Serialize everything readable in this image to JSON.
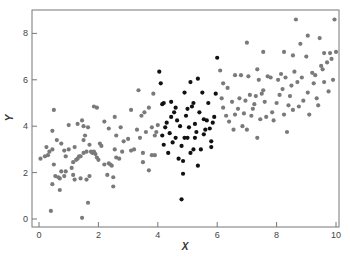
{
  "chart_data": {
    "type": "scatter",
    "title": "",
    "xlabel": "X",
    "ylabel": "Y",
    "xlim": [
      -0.2,
      10.1
    ],
    "ylim": [
      -0.35,
      9.0
    ],
    "xticks": [
      0,
      2,
      4,
      6,
      8,
      10
    ],
    "yticks": [
      0,
      2,
      4,
      6,
      8
    ],
    "grid": false,
    "legend": null,
    "colors": {
      "gray": "#7a7a7a",
      "black": "#111111",
      "axis": "#777777"
    },
    "series": [
      {
        "name": "outside 4–6 (gray)",
        "color": "#7a7a7a",
        "points": [
          [
            0.05,
            2.6
          ],
          [
            0.2,
            2.7
          ],
          [
            0.25,
            3.1
          ],
          [
            0.3,
            2.75
          ],
          [
            0.35,
            2.9
          ],
          [
            0.45,
            3.0
          ],
          [
            0.45,
            3.8
          ],
          [
            0.45,
            1.5
          ],
          [
            0.4,
            0.35
          ],
          [
            0.5,
            2.35
          ],
          [
            0.55,
            1.85
          ],
          [
            0.6,
            3.4
          ],
          [
            0.65,
            1.8
          ],
          [
            0.7,
            1.75
          ],
          [
            0.7,
            1.25
          ],
          [
            0.75,
            2.05
          ],
          [
            0.75,
            3.25
          ],
          [
            0.85,
            1.85
          ],
          [
            0.85,
            2.95
          ],
          [
            0.9,
            2.05
          ],
          [
            0.9,
            2.7
          ],
          [
            1.0,
            3.0
          ],
          [
            1.1,
            2.2
          ],
          [
            1.15,
            1.9
          ],
          [
            1.15,
            2.45
          ],
          [
            1.2,
            1.7
          ],
          [
            1.2,
            3.1
          ],
          [
            1.25,
            2.55
          ],
          [
            1.3,
            2.6
          ],
          [
            1.35,
            2.7
          ],
          [
            1.4,
            2.7
          ],
          [
            1.4,
            1.75
          ],
          [
            1.45,
            0.05
          ],
          [
            1.5,
            2.85
          ],
          [
            1.5,
            3.4
          ],
          [
            1.55,
            3.6
          ],
          [
            1.6,
            2.9
          ],
          [
            1.6,
            1.7
          ],
          [
            1.65,
            0.7
          ],
          [
            1.7,
            3.2
          ],
          [
            1.7,
            1.85
          ],
          [
            1.75,
            2.9
          ],
          [
            1.8,
            2.85
          ],
          [
            1.85,
            2.9
          ],
          [
            1.9,
            2.8
          ],
          [
            1.95,
            2.65
          ],
          [
            2.0,
            2.55
          ],
          [
            2.05,
            3.25
          ],
          [
            2.1,
            3.15
          ],
          [
            2.2,
            2.35
          ],
          [
            2.3,
            1.9
          ],
          [
            2.35,
            2.4
          ],
          [
            2.4,
            2.35
          ],
          [
            2.45,
            2.3
          ],
          [
            2.5,
            1.4
          ],
          [
            2.5,
            1.8
          ],
          [
            2.55,
            3.0
          ],
          [
            2.6,
            2.65
          ],
          [
            2.6,
            3.6
          ],
          [
            2.7,
            2.6
          ],
          [
            2.8,
            2.9
          ],
          [
            2.85,
            3.35
          ],
          [
            3.1,
            2.95
          ],
          [
            3.2,
            3.0
          ],
          [
            3.5,
            2.45
          ],
          [
            3.5,
            2.85
          ],
          [
            3.7,
            2.1
          ],
          [
            3.8,
            2.75
          ],
          [
            3.9,
            2.75
          ],
          [
            0.5,
            4.7
          ],
          [
            1.0,
            4.05
          ],
          [
            1.3,
            4.1
          ],
          [
            1.45,
            4.25
          ],
          [
            1.5,
            4.0
          ],
          [
            1.65,
            3.95
          ],
          [
            1.85,
            4.85
          ],
          [
            1.95,
            4.8
          ],
          [
            2.2,
            4.2
          ],
          [
            2.35,
            3.9
          ],
          [
            2.55,
            4.4
          ],
          [
            2.75,
            3.95
          ],
          [
            3.1,
            4.7
          ],
          [
            3.35,
            5.55
          ],
          [
            3.45,
            4.45
          ],
          [
            3.55,
            4.6
          ],
          [
            3.7,
            4.8
          ],
          [
            3.85,
            5.4
          ],
          [
            3.4,
            3.5
          ],
          [
            3.6,
            3.75
          ],
          [
            3.8,
            3.95
          ],
          [
            3.9,
            3.6
          ],
          [
            3.95,
            3.75
          ],
          [
            4.0,
            4.05
          ],
          [
            3.3,
            3.85
          ],
          [
            3.0,
            3.45
          ],
          [
            6.1,
            6.4
          ],
          [
            6.15,
            5.2
          ],
          [
            6.2,
            4.8
          ],
          [
            6.3,
            4.45
          ],
          [
            6.35,
            5.65
          ],
          [
            6.4,
            4.2
          ],
          [
            6.5,
            5.05
          ],
          [
            6.55,
            3.85
          ],
          [
            6.6,
            4.5
          ],
          [
            6.7,
            4.75
          ],
          [
            6.75,
            5.2
          ],
          [
            6.8,
            6.2
          ],
          [
            6.85,
            4.0
          ],
          [
            6.9,
            4.55
          ],
          [
            6.95,
            5.1
          ],
          [
            7.0,
            3.85
          ],
          [
            7.05,
            6.15
          ],
          [
            7.1,
            5.35
          ],
          [
            7.15,
            4.45
          ],
          [
            7.2,
            4.75
          ],
          [
            7.25,
            4.95
          ],
          [
            7.3,
            5.3
          ],
          [
            7.35,
            3.5
          ],
          [
            7.4,
            6.0
          ],
          [
            7.45,
            4.3
          ],
          [
            7.5,
            5.4
          ],
          [
            7.55,
            7.2
          ],
          [
            7.6,
            5.05
          ],
          [
            7.65,
            4.4
          ],
          [
            7.7,
            6.15
          ],
          [
            7.8,
            6.1
          ],
          [
            7.85,
            4.6
          ],
          [
            7.9,
            4.25
          ],
          [
            8.0,
            5.0
          ],
          [
            8.05,
            6.0
          ],
          [
            8.1,
            5.35
          ],
          [
            8.15,
            6.25
          ],
          [
            8.2,
            5.6
          ],
          [
            8.25,
            4.5
          ],
          [
            8.3,
            6.1
          ],
          [
            8.35,
            3.75
          ],
          [
            8.4,
            4.9
          ],
          [
            8.45,
            5.3
          ],
          [
            8.5,
            5.75
          ],
          [
            8.55,
            4.7
          ],
          [
            8.6,
            6.35
          ],
          [
            8.65,
            8.6
          ],
          [
            8.7,
            5.9
          ],
          [
            8.75,
            4.85
          ],
          [
            8.8,
            7.55
          ],
          [
            8.85,
            6.1
          ],
          [
            8.9,
            5.1
          ],
          [
            9.0,
            7.0
          ],
          [
            9.05,
            5.45
          ],
          [
            9.1,
            4.5
          ],
          [
            9.2,
            6.3
          ],
          [
            9.25,
            5.85
          ],
          [
            9.3,
            6.2
          ],
          [
            9.35,
            5.2
          ],
          [
            9.4,
            4.9
          ],
          [
            9.45,
            7.8
          ],
          [
            9.5,
            6.6
          ],
          [
            9.55,
            6.45
          ],
          [
            9.6,
            5.9
          ],
          [
            9.7,
            6.75
          ],
          [
            9.75,
            5.5
          ],
          [
            9.8,
            7.15
          ],
          [
            9.85,
            6.9
          ],
          [
            9.9,
            6.0
          ],
          [
            9.95,
            8.6
          ],
          [
            10.0,
            7.2
          ],
          [
            7.0,
            7.6
          ],
          [
            7.35,
            6.45
          ],
          [
            8.25,
            7.2
          ],
          [
            8.55,
            7.05
          ],
          [
            9.05,
            7.9
          ],
          [
            9.6,
            7.15
          ],
          [
            6.2,
            5.85
          ],
          [
            6.6,
            6.2
          ],
          [
            7.55,
            5.55
          ]
        ]
      },
      {
        "name": "4 ≤ x ≤ 6 (black)",
        "color": "#111111",
        "points": [
          [
            4.05,
            6.35
          ],
          [
            4.1,
            5.85
          ],
          [
            4.15,
            4.95
          ],
          [
            4.2,
            5.0
          ],
          [
            4.15,
            3.6
          ],
          [
            4.2,
            3.2
          ],
          [
            4.25,
            3.95
          ],
          [
            4.3,
            4.15
          ],
          [
            4.35,
            2.85
          ],
          [
            4.4,
            3.7
          ],
          [
            4.45,
            5.05
          ],
          [
            4.5,
            3.3
          ],
          [
            4.55,
            4.6
          ],
          [
            4.6,
            4.8
          ],
          [
            4.65,
            4.25
          ],
          [
            4.7,
            2.6
          ],
          [
            4.75,
            4.0
          ],
          [
            4.8,
            3.15
          ],
          [
            4.85,
            2.5
          ],
          [
            4.85,
            1.95
          ],
          [
            4.8,
            0.85
          ],
          [
            4.9,
            5.45
          ],
          [
            4.95,
            4.45
          ],
          [
            5.0,
            3.5
          ],
          [
            5.05,
            3.95
          ],
          [
            5.1,
            2.85
          ],
          [
            5.15,
            4.85
          ],
          [
            5.2,
            5.0
          ],
          [
            5.25,
            3.5
          ],
          [
            5.3,
            3.75
          ],
          [
            5.35,
            6.05
          ],
          [
            5.4,
            4.6
          ],
          [
            5.45,
            3.0
          ],
          [
            5.5,
            5.45
          ],
          [
            5.55,
            4.3
          ],
          [
            5.6,
            3.85
          ],
          [
            5.65,
            4.25
          ],
          [
            5.7,
            5.0
          ],
          [
            5.75,
            3.9
          ],
          [
            5.8,
            3.35
          ],
          [
            5.85,
            4.15
          ],
          [
            5.9,
            4.4
          ],
          [
            5.95,
            5.4
          ],
          [
            6.0,
            6.95
          ],
          [
            5.25,
            4.1
          ],
          [
            5.35,
            2.3
          ],
          [
            4.9,
            3.5
          ],
          [
            5.0,
            4.75
          ],
          [
            5.55,
            3.65
          ],
          [
            4.45,
            4.4
          ],
          [
            5.1,
            5.9
          ],
          [
            5.8,
            3.1
          ],
          [
            4.6,
            3.5
          ],
          [
            5.2,
            3.0
          ]
        ]
      }
    ]
  }
}
